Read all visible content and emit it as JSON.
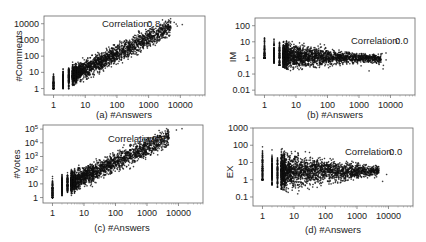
{
  "chart_data": [
    {
      "type": "scatter",
      "panel": "a",
      "xlabel": "(a) #Answers",
      "ylabel": "#Comments",
      "xscale": "log",
      "yscale": "log",
      "xlim": [
        0.5,
        60000
      ],
      "ylim": [
        0.4,
        30000
      ],
      "xticks": [
        "1",
        "10",
        "100",
        "1000",
        "10000"
      ],
      "yticks": [
        "1",
        "10",
        "100",
        "1000",
        "10000"
      ],
      "annotation": {
        "label": "Correlation:",
        "value": "0.8"
      },
      "trend": "positive, dense cloud from x=1..1000, y=1..3000; outliers up to x~15000, y~10000"
    },
    {
      "type": "scatter",
      "panel": "b",
      "xlabel": "(b) #Answers",
      "ylabel": "IM",
      "xscale": "log",
      "yscale": "log",
      "xlim": [
        0.5,
        60000
      ],
      "ylim": [
        0.005,
        300
      ],
      "xticks": [
        "1",
        "10",
        "100",
        "1000",
        "10000"
      ],
      "yticks": [
        "0.01",
        "0.1",
        "1",
        "10",
        "100"
      ],
      "annotation": {
        "label": "Correlation:",
        "value": "0.0"
      },
      "trend": "flat; vertical stripes at x=1..5, lower boundary declining diagonal, cloud converging near y~1 at x~1000"
    },
    {
      "type": "scatter",
      "panel": "c",
      "xlabel": "(c) #Answers",
      "ylabel": "#Votes",
      "xscale": "log",
      "yscale": "log",
      "xlim": [
        0.5,
        60000
      ],
      "ylim": [
        0.4,
        200000
      ],
      "xticks": [
        "1",
        "10",
        "100",
        "1000",
        "10000"
      ],
      "yticks": [
        "1",
        "10",
        "10^2",
        "10^3",
        "10^4",
        "10^5"
      ],
      "annotation": {
        "label": "Correlation:",
        "value": "0.9"
      },
      "trend": "strong positive; upper points reaching y~1e5 at x~15000"
    },
    {
      "type": "scatter",
      "panel": "d",
      "xlabel": "(d) #Answers",
      "ylabel": "EX",
      "xscale": "log",
      "yscale": "log",
      "xlim": [
        0.5,
        60000
      ],
      "ylim": [
        0.03,
        1000
      ],
      "xticks": [
        "1",
        "10",
        "100",
        "1000",
        "10000"
      ],
      "yticks": [
        "0.1",
        "1",
        "10",
        "100",
        "1000"
      ],
      "annotation": {
        "label": "Correlation:",
        "value": "0.0"
      },
      "trend": "flat; vertical stripes at x=1..5 spanning up to ~400, cloud narrowing toward y~3 near x~10000"
    }
  ],
  "panels": {
    "a": {
      "xlabel": "(a) #Answers",
      "ylabel": "#Comments",
      "corr_label": "Correlation:",
      "corr_value": "0.8"
    },
    "b": {
      "xlabel": "(b) #Answers",
      "ylabel": "IM",
      "corr_label": "Correlation:",
      "corr_value": "0.0"
    },
    "c": {
      "xlabel": "(c) #Answers",
      "ylabel": "#Votes",
      "corr_label": "Correlation:",
      "corr_value": "0.9"
    },
    "d": {
      "xlabel": "(d) #Answers",
      "ylabel": "EX",
      "corr_label": "Correlation:",
      "corr_value": "0.0"
    }
  },
  "colors": {
    "points": "#111111",
    "axis": "#555555"
  }
}
